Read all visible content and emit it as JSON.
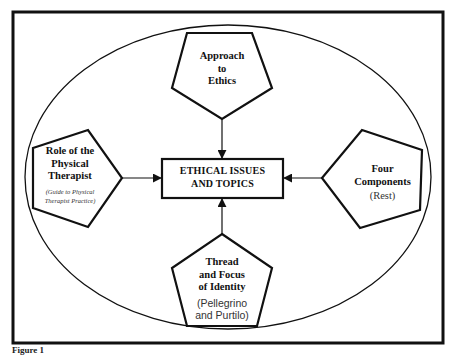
{
  "diagram": {
    "center": {
      "line1": "ETHICAL ISSUES",
      "line2": "AND TOPICS"
    },
    "top": {
      "line1": "Approach",
      "line2": "to",
      "line3": "Ethics"
    },
    "left": {
      "line1": "Role of the",
      "line2": "Physical",
      "line3": "Therapist",
      "sub1": "(Guide to Physical",
      "sub2": "Therapist Practice)"
    },
    "right": {
      "line1": "Four",
      "line2": "Components",
      "sub": "(Rest)"
    },
    "bottom": {
      "line1": "Thread",
      "line2": "and Focus",
      "line3": "of Identity",
      "sub1": "(Pellegrino",
      "sub2": "and Purtilo)"
    },
    "edges": [
      {
        "from": "top",
        "to": "center"
      },
      {
        "from": "left",
        "to": "center"
      },
      {
        "from": "right",
        "to": "center"
      },
      {
        "from": "bottom",
        "to": "center"
      }
    ],
    "colors": {
      "stroke": "#111111",
      "background": "#ffffff"
    }
  },
  "caption": "Figure 1"
}
